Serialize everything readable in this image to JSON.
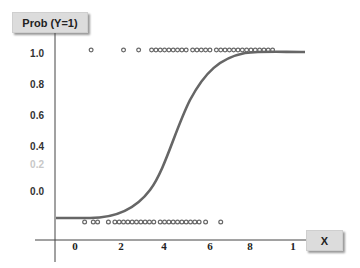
{
  "chart_data": {
    "type": "scatter",
    "title": "",
    "ylabel": "Prob (Y=1)",
    "xlabel": "X",
    "y_ticks": [
      "1.0",
      "0.8",
      "0.6",
      "0.4",
      "0.2",
      "0.0"
    ],
    "x_ticks": [
      "0",
      "2",
      "4",
      "6",
      "8",
      "1"
    ],
    "ylim": [
      0,
      1
    ],
    "xlim": [
      0,
      10
    ],
    "grid": false,
    "series": [
      {
        "name": "Observations Y=1",
        "type": "scatter",
        "y": 1,
        "x": [
          0.7,
          2.2,
          2.9,
          3.5,
          3.7,
          3.9,
          4.1,
          4.3,
          4.5,
          4.7,
          4.9,
          5.1,
          5.4,
          5.6,
          5.8,
          6.0,
          6.2,
          6.5,
          6.7,
          6.9,
          7.1,
          7.3,
          7.5,
          7.7,
          7.9,
          8.1,
          8.3,
          8.5,
          8.7,
          8.9,
          9.1
        ]
      },
      {
        "name": "Observations Y=0",
        "type": "scatter",
        "y": 0,
        "x": [
          0.4,
          0.8,
          1.0,
          1.5,
          1.8,
          2.0,
          2.2,
          2.4,
          2.6,
          2.8,
          3.0,
          3.2,
          3.4,
          3.6,
          3.9,
          4.1,
          4.3,
          4.5,
          4.7,
          4.9,
          5.1,
          5.3,
          5.5,
          5.7,
          6.0,
          6.7
        ]
      },
      {
        "name": "Logistic curve",
        "type": "line",
        "description": "Sigmoid P(Y=1|X), midpoint near X≈5",
        "x": [
          -0.8,
          0,
          1,
          2,
          3,
          4,
          5,
          6,
          7,
          8,
          9,
          10
        ],
        "y": [
          0.0,
          0.0,
          0.01,
          0.04,
          0.13,
          0.33,
          0.6,
          0.84,
          0.96,
          0.99,
          1.0,
          1.0
        ]
      }
    ]
  },
  "axes": {
    "ylabel": "Prob (Y=1)",
    "xlabel": "X"
  }
}
